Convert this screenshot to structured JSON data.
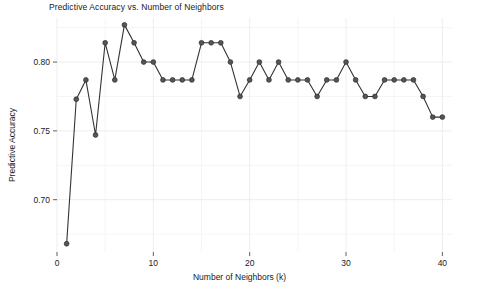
{
  "chart_data": {
    "type": "line",
    "title": "Predictive Accuracy vs. Number of Neighbors",
    "xlabel": "Number of Neighbors (k)",
    "ylabel": "Predictive Accuracy",
    "xlim": [
      0,
      41
    ],
    "ylim": [
      0.662,
      0.832
    ],
    "grid": true,
    "legend": null,
    "marker": "circle",
    "line_color": "#333333",
    "marker_color": "#555555",
    "grid_color": "#ebebeb",
    "background_color": "#ffffff",
    "xticks": [
      0,
      10,
      20,
      30,
      40
    ],
    "xtick_labels": [
      "0",
      "10",
      "20",
      "30",
      "40"
    ],
    "yticks": [
      0.7,
      0.75,
      0.8
    ],
    "ytick_labels": [
      "0.70",
      "0.75",
      "0.80"
    ],
    "minor_yticks": [
      0.675,
      0.725,
      0.775,
      0.825
    ],
    "minor_xticks": [
      5,
      15,
      25,
      35
    ],
    "x": [
      1,
      2,
      3,
      4,
      5,
      6,
      7,
      8,
      9,
      10,
      11,
      12,
      13,
      14,
      15,
      16,
      17,
      18,
      19,
      20,
      21,
      22,
      23,
      24,
      25,
      26,
      27,
      28,
      29,
      30,
      31,
      32,
      33,
      34,
      35,
      36,
      37,
      38,
      39,
      40
    ],
    "y": [
      0.668,
      0.773,
      0.787,
      0.747,
      0.814,
      0.787,
      0.827,
      0.814,
      0.8,
      0.8,
      0.787,
      0.787,
      0.787,
      0.787,
      0.814,
      0.814,
      0.814,
      0.8,
      0.775,
      0.787,
      0.8,
      0.787,
      0.8,
      0.787,
      0.787,
      0.787,
      0.775,
      0.787,
      0.787,
      0.8,
      0.787,
      0.775,
      0.775,
      0.787,
      0.787,
      0.787,
      0.787,
      0.775,
      0.76,
      0.76
    ],
    "series_name": "Predictive Accuracy"
  }
}
